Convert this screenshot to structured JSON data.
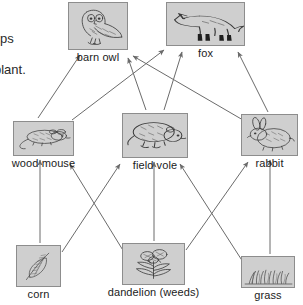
{
  "diagram": {
    "background_color": "#ffffff",
    "box_fill_color": "#cfcfcf",
    "box_border_color": "#8d8d8d",
    "arrow_color": "#6b6b6b",
    "label_color": "#1b1b1b"
  },
  "margin_text": [
    {
      "id": "fragment-1",
      "text": "ps",
      "x": 0,
      "y": 32
    },
    {
      "id": "fragment-2",
      "text": "plant.",
      "x": -6,
      "y": 63
    }
  ],
  "nodes": [
    {
      "id": "barn-owl",
      "label": "barn owl",
      "icon": "barn-owl-illustration",
      "trophic_level": "tertiary consumer",
      "box": {
        "x": 68,
        "y": 2,
        "w": 60,
        "h": 48
      },
      "label_y": 51
    },
    {
      "id": "fox",
      "label": "fox",
      "icon": "fox-illustration",
      "trophic_level": "tertiary consumer",
      "box": {
        "x": 166,
        "y": 2,
        "w": 79,
        "h": 44
      },
      "label_y": 47
    },
    {
      "id": "wood-mouse",
      "label": "wood mouse",
      "icon": "wood-mouse-illustration",
      "trophic_level": "primary consumer",
      "box": {
        "x": 13,
        "y": 121,
        "w": 61,
        "h": 35
      },
      "label_y": 157
    },
    {
      "id": "field-vole",
      "label": "field vole",
      "icon": "field-vole-illustration",
      "trophic_level": "primary consumer",
      "box": {
        "x": 122,
        "y": 113,
        "w": 66,
        "h": 45
      },
      "label_y": 159
    },
    {
      "id": "rabbit",
      "label": "rabbit",
      "icon": "rabbit-illustration",
      "trophic_level": "primary consumer",
      "box": {
        "x": 241,
        "y": 114,
        "w": 57,
        "h": 42
      },
      "label_y": 157
    },
    {
      "id": "corn",
      "label": "corn",
      "icon": "corn-illustration",
      "trophic_level": "producer",
      "box": {
        "x": 16,
        "y": 245,
        "w": 45,
        "h": 42
      },
      "label_y": 288
    },
    {
      "id": "dandelion",
      "label": "dandelion (weeds)",
      "icon": "dandelion-illustration",
      "trophic_level": "producer",
      "box": {
        "x": 122,
        "y": 243,
        "w": 63,
        "h": 42
      },
      "label_y": 286
    },
    {
      "id": "grass",
      "label": "grass",
      "icon": "grass-illustration",
      "trophic_level": "producer",
      "box": {
        "x": 241,
        "y": 256,
        "w": 54,
        "h": 32
      },
      "label_y": 289
    }
  ],
  "arrows": [
    {
      "id": "corn-to-wood-mouse",
      "from": "corn",
      "to": "wood-mouse",
      "x1": 40,
      "y1": 243,
      "x2": 40,
      "y2": 160
    },
    {
      "id": "dandelion-to-field-vole",
      "from": "dandelion",
      "to": "field-vole",
      "x1": 154,
      "y1": 241,
      "x2": 154,
      "y2": 162
    },
    {
      "id": "grass-to-rabbit",
      "from": "grass",
      "to": "rabbit",
      "x1": 270,
      "y1": 254,
      "x2": 270,
      "y2": 160
    },
    {
      "id": "corn-to-field-vole",
      "from": "corn",
      "to": "field-vole",
      "x1": 62,
      "y1": 252,
      "x2": 120,
      "y2": 164
    },
    {
      "id": "dandelion-to-wood-mouse",
      "from": "dandelion",
      "to": "wood-mouse",
      "x1": 124,
      "y1": 252,
      "x2": 70,
      "y2": 164
    },
    {
      "id": "grass-to-field-vole",
      "from": "grass",
      "to": "field-vole",
      "x1": 243,
      "y1": 262,
      "x2": 180,
      "y2": 164
    },
    {
      "id": "dandelion-to-rabbit",
      "from": "dandelion",
      "to": "rabbit",
      "x1": 186,
      "y1": 250,
      "x2": 248,
      "y2": 162
    },
    {
      "id": "wood-mouse-to-barn-owl",
      "from": "wood-mouse",
      "to": "barn-owl",
      "x1": 38,
      "y1": 118,
      "x2": 80,
      "y2": 55
    },
    {
      "id": "field-vole-to-barn-owl",
      "from": "field-vole",
      "to": "barn-owl",
      "x1": 146,
      "y1": 110,
      "x2": 128,
      "y2": 58
    },
    {
      "id": "field-vole-to-fox",
      "from": "field-vole",
      "to": "fox",
      "x1": 164,
      "y1": 110,
      "x2": 182,
      "y2": 52
    },
    {
      "id": "wood-mouse-to-fox",
      "from": "wood-mouse",
      "to": "fox",
      "x1": 72,
      "y1": 120,
      "x2": 164,
      "y2": 50
    },
    {
      "id": "rabbit-to-fox",
      "from": "rabbit",
      "to": "fox",
      "x1": 268,
      "y1": 112,
      "x2": 238,
      "y2": 52
    },
    {
      "id": "rabbit-to-barn-owl",
      "from": "rabbit",
      "to": "barn-owl",
      "x1": 243,
      "y1": 120,
      "x2": 133,
      "y2": 56
    }
  ]
}
